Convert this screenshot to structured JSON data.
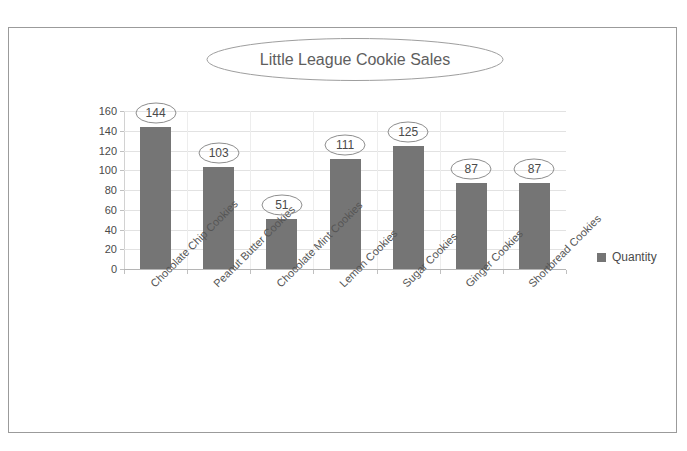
{
  "chart_data": {
    "type": "bar",
    "title": "Little League Cookie Sales",
    "xlabel": "",
    "ylabel": "",
    "ylim": [
      0,
      160
    ],
    "ytick_step": 20,
    "yticks": [
      160,
      140,
      120,
      100,
      80,
      60,
      40,
      20,
      0
    ],
    "grid": true,
    "legend_position": "right",
    "categories": [
      "Chocolate Chip Cookies",
      "Peanut Butter Cookies",
      "Chocolate Mint Cookies",
      "Lemon Cookies",
      "Sugar Cookies",
      "Ginger Cookies",
      "Shortbread Cookies"
    ],
    "series": [
      {
        "name": "Quantity",
        "values": [
          144,
          103,
          51,
          111,
          125,
          87,
          87
        ]
      }
    ],
    "data_labels": [
      "144",
      "103",
      "51",
      "111",
      "125",
      "87",
      "87"
    ],
    "colors": {
      "bar": "#757575",
      "gridline": "#e2e2e2",
      "axis": "#b5b5b5",
      "text": "#4a4a4a",
      "frame": "#9b9b9b",
      "callout_outline": "#8e8e8e"
    }
  },
  "legend": {
    "items": [
      {
        "label": "Quantity",
        "color": "#757575"
      }
    ]
  }
}
